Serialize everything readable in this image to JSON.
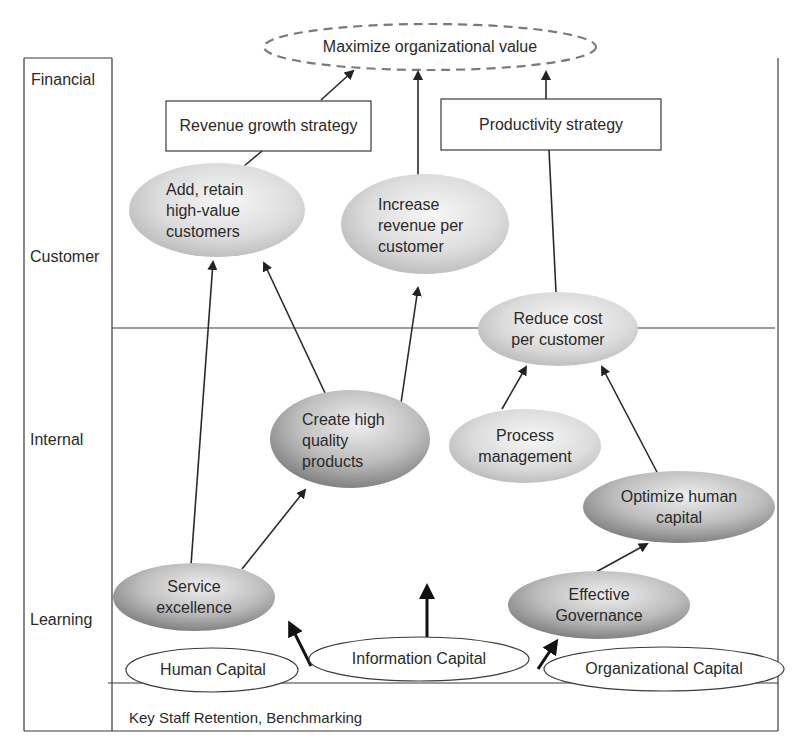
{
  "perspectives": [
    {
      "label": "Financial"
    },
    {
      "label": "Customer"
    },
    {
      "label": "Internal"
    },
    {
      "label": "Learning"
    }
  ],
  "goal": {
    "label": "Maximize organizational value"
  },
  "strategies": [
    {
      "label": "Revenue growth strategy"
    },
    {
      "label": "Productivity strategy"
    }
  ],
  "customer_objectives": [
    {
      "label": "Add, retain\nhigh-value\ncustomers"
    },
    {
      "label": "Increase\nrevenue per\ncustomer"
    },
    {
      "label": "Reduce cost\nper customer"
    }
  ],
  "internal_objectives": [
    {
      "label": "Create high\nquality\nproducts"
    },
    {
      "label": "Process\nmanagement"
    },
    {
      "label": "Optimize human\ncapital"
    }
  ],
  "learning_objectives": [
    {
      "label": "Service\nexcellence"
    },
    {
      "label": "Effective\nGovernance"
    }
  ],
  "capitals": [
    {
      "label": "Human Capital"
    },
    {
      "label": "Information Capital"
    },
    {
      "label": "Organizational Capital"
    }
  ],
  "footer": {
    "label": "Key Staff Retention, Benchmarking"
  },
  "colors": {
    "line": "#3a3a3a",
    "dashed": "#7a7a7a",
    "ellipse_light": "#efefef",
    "ellipse_dark": "#8e8e8e"
  }
}
